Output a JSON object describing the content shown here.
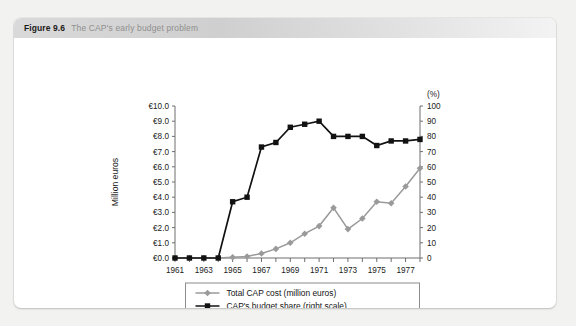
{
  "figure": {
    "number": "Figure 9.6",
    "title": "The CAP's early budget problem"
  },
  "chart_data": {
    "type": "line",
    "title": "The CAP's early budget problem",
    "xlabel": "",
    "ylabel": "Million euros",
    "y2label": "(%)",
    "x": [
      1961,
      1962,
      1963,
      1964,
      1965,
      1966,
      1967,
      1968,
      1969,
      1970,
      1971,
      1972,
      1973,
      1974,
      1975,
      1976,
      1977,
      1978
    ],
    "xtick_labels": [
      "1961",
      "",
      "1963",
      "",
      "1965",
      "",
      "1967",
      "",
      "1969",
      "",
      "1971",
      "",
      "1973",
      "",
      "1975",
      "",
      "1977",
      ""
    ],
    "ylim": [
      0,
      10
    ],
    "ytick_labels": [
      "€0.0",
      "€1.0",
      "€2.0",
      "€3.0",
      "€4.0",
      "€5.0",
      "€6.0",
      "€7.0",
      "€8.0",
      "€9.0",
      "€10.0"
    ],
    "y2lim": [
      0,
      100
    ],
    "y2tick_labels": [
      "0",
      "10",
      "20",
      "30",
      "40",
      "50",
      "60",
      "70",
      "80",
      "90",
      "100"
    ],
    "grid": false,
    "legend_position": "bottom",
    "series": [
      {
        "name": "Total CAP cost (million euros)",
        "axis": "left",
        "color": "#9a9a9a",
        "marker": "diamond",
        "values": [
          0.0,
          0.0,
          0.0,
          0.0,
          0.05,
          0.1,
          0.3,
          0.6,
          1.0,
          1.6,
          2.1,
          3.3,
          1.9,
          2.6,
          3.7,
          3.6,
          4.7,
          5.9
        ]
      },
      {
        "name": "CAP's budget share (right scale)",
        "axis": "right",
        "color": "#121212",
        "marker": "square",
        "values": [
          0,
          0,
          0,
          0,
          37,
          40,
          73,
          76,
          86,
          88,
          90,
          80,
          80,
          80,
          74,
          77,
          77,
          78
        ]
      }
    ],
    "series_extended_note": ""
  },
  "legend": {
    "entries": [
      {
        "label": "Total CAP cost (million euros)",
        "color": "#9a9a9a",
        "marker": "diamond"
      },
      {
        "label": "CAP's budget share (right scale)",
        "color": "#121212",
        "marker": "square"
      }
    ]
  }
}
